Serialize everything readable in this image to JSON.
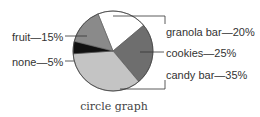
{
  "chart_data": {
    "type": "pie",
    "title": "circle graph",
    "categories": [
      "granola bar",
      "cookies",
      "candy bar",
      "none",
      "fruit"
    ],
    "values": [
      20,
      25,
      35,
      5,
      15
    ],
    "unit": "%",
    "labels": [
      "granola bar—20%",
      "cookies—25%",
      "candy bar—35%",
      "none—5%",
      "fruit—15%"
    ],
    "colors": [
      "#ffffff",
      "#6e6e6e",
      "#c4c4c4",
      "#111111",
      "#8a8a8a"
    ],
    "legend": "none (direct labels with leader lines)"
  },
  "caption": "circle graph"
}
